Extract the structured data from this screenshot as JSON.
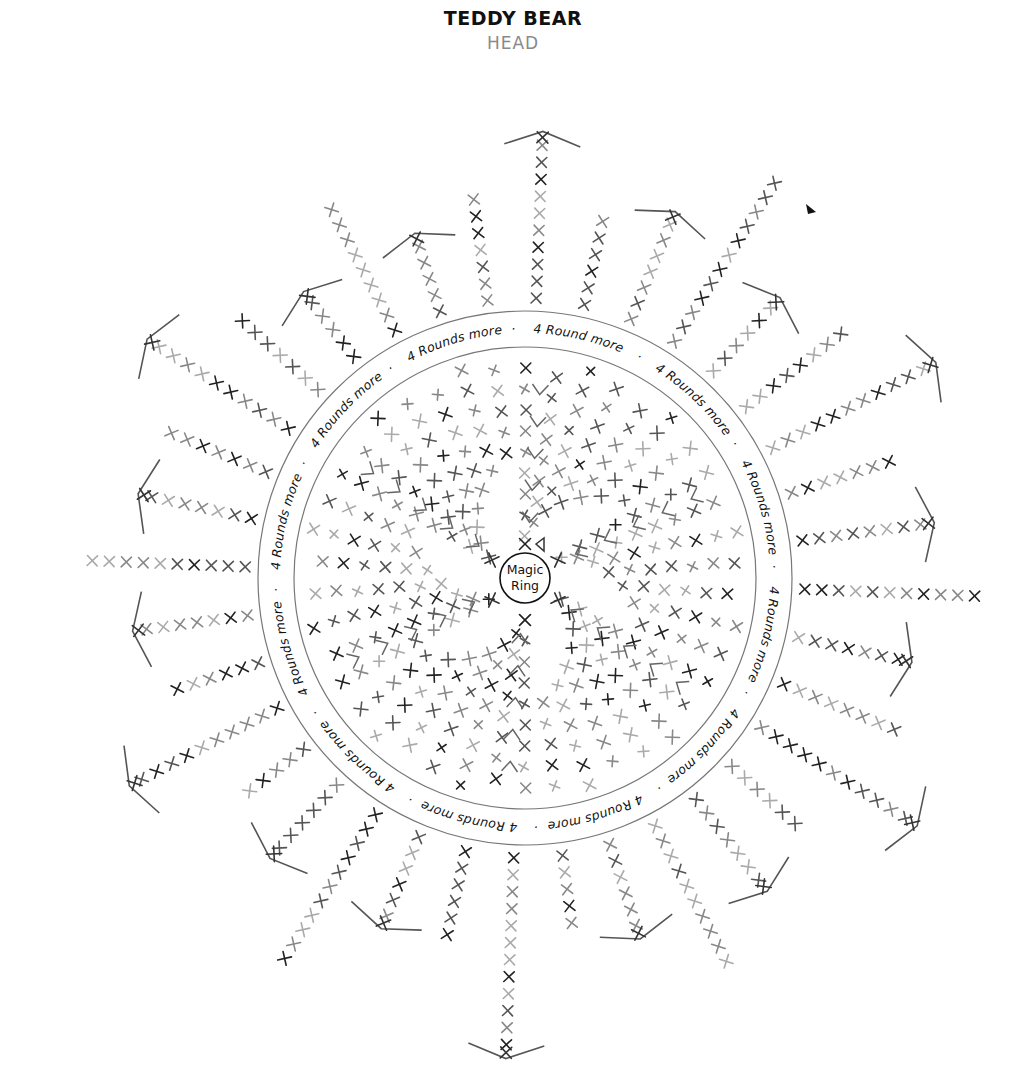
{
  "header": {
    "title": "TEDDY BEAR",
    "subtitle": "HEAD"
  },
  "diagram": {
    "type": "amigurumi crochet chart (single crochet in the round)",
    "center_label_line1": "Magic",
    "center_label_line2": "Ring",
    "ring_label_segments": [
      "4 Rounds more",
      "4 Rounds more",
      "4 Rounds more",
      "4 Rounds more",
      "4 Rounds more",
      "4 Rounds more",
      "4 Round more",
      "4 Rounds more",
      "4 Rounds more",
      "4 Rounds more",
      "4 Rounds more",
      "4 Rounds more"
    ],
    "ring_separator": "·",
    "symbols": {
      "single_crochet": "x",
      "increase": "V",
      "decrease": "inverted-V",
      "round_end_marker": "black-triangle"
    },
    "stitch_colors": [
      "#222222",
      "#555555",
      "#888888",
      "#aaaaaa"
    ],
    "line_color": "#555555",
    "ring_color": "#777777",
    "inner_section": {
      "description": "increase rounds from magic ring",
      "rays": 6
    },
    "outer_section": {
      "description": "decrease rounds after 4 rounds more",
      "rays": 30
    }
  }
}
